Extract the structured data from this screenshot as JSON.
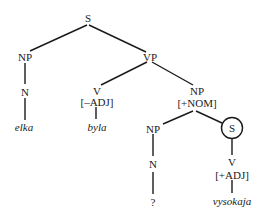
{
  "tree": {
    "nodes": {
      "s_root": "S",
      "np_subj": "NP",
      "n_subj": "N",
      "leaf_elka": "elka",
      "vp": "VP",
      "v_main": "V",
      "v_main_feat": "[–ADJ]",
      "leaf_byla": "byla",
      "np_pred": "NP",
      "np_pred_feat": "[+NOM]",
      "np_inner": "NP",
      "n_inner": "N",
      "leaf_unknown": "?",
      "s_embedded": "S",
      "v_embedded": "V",
      "v_embedded_feat": "[+ADJ]",
      "leaf_vysokaja": "vysokaja"
    },
    "edges": [
      [
        "S",
        "NP"
      ],
      [
        "S",
        "VP"
      ],
      [
        "NP",
        "N"
      ],
      [
        "N",
        "elka"
      ],
      [
        "VP",
        "V[–ADJ]"
      ],
      [
        "VP",
        "NP[+NOM]"
      ],
      [
        "V[–ADJ]",
        "byla"
      ],
      [
        "NP[+NOM]",
        "NP"
      ],
      [
        "NP[+NOM]",
        "(S)"
      ],
      [
        "NP",
        "N"
      ],
      [
        "N",
        "?"
      ],
      [
        "(S)",
        "V[+ADJ]"
      ],
      [
        "V[+ADJ]",
        "vysokaja"
      ]
    ],
    "circled_node": "s_embedded",
    "line_color": "#1a1a1a"
  }
}
